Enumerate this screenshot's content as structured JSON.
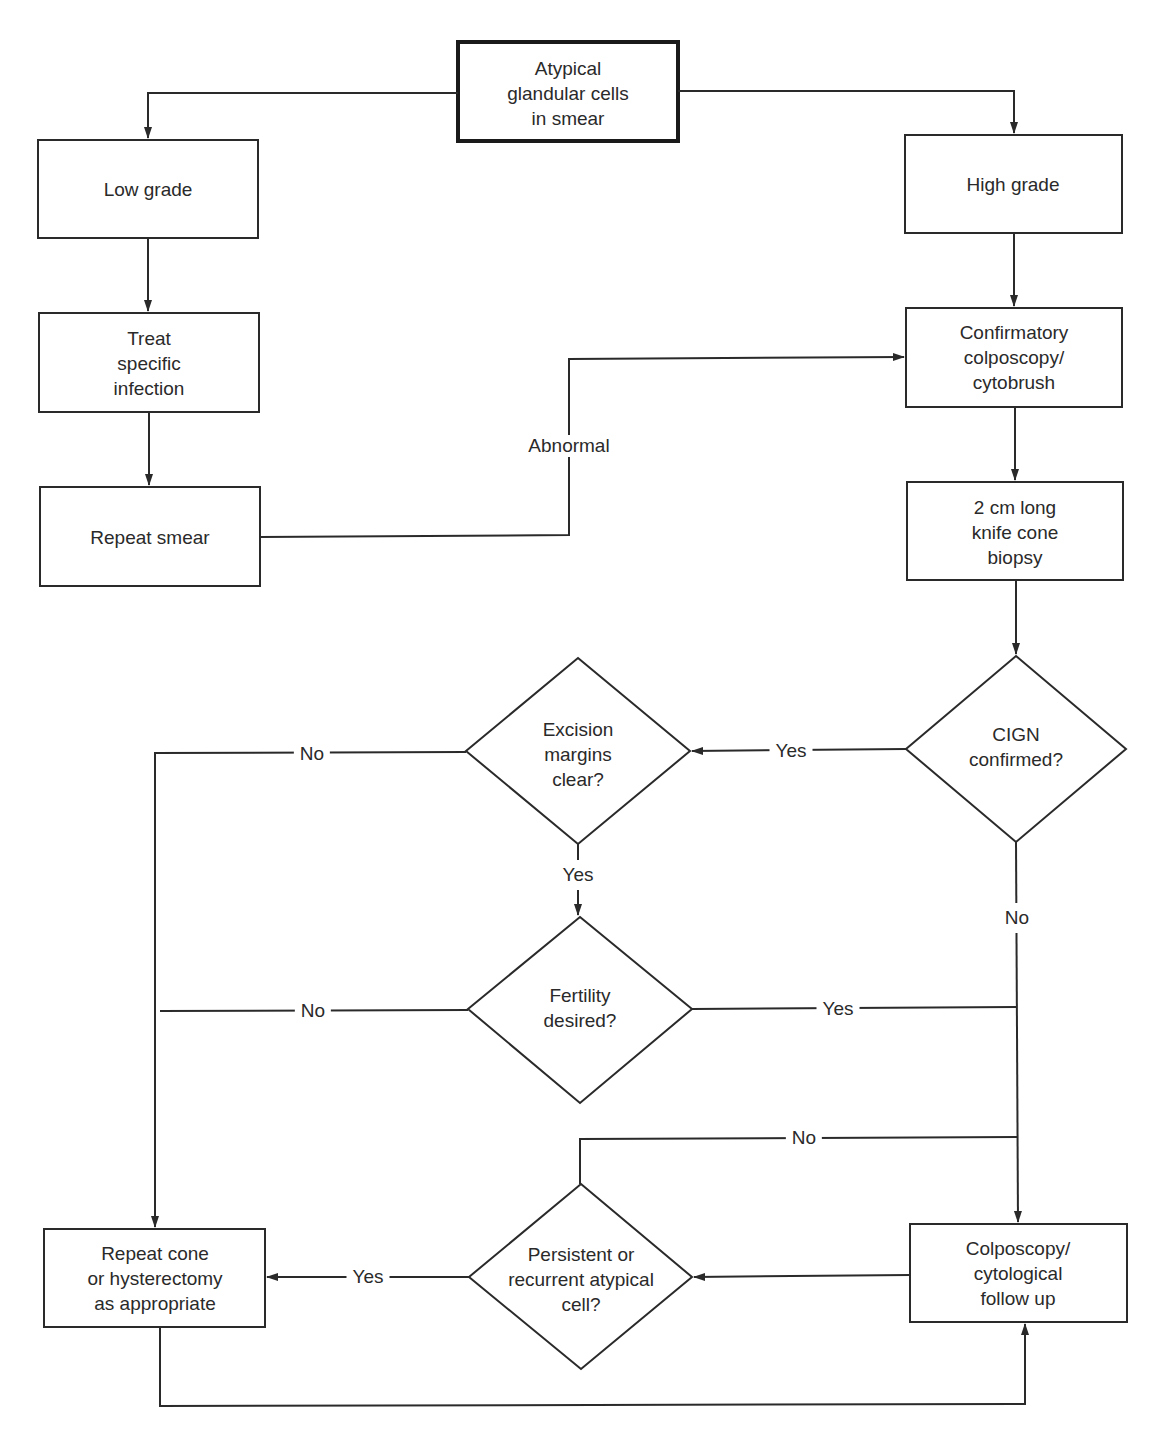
{
  "nodes": {
    "start": {
      "lines": [
        "Atypical",
        "glandular cells",
        "in smear"
      ]
    },
    "low_grade": {
      "lines": [
        "Low grade"
      ]
    },
    "high_grade": {
      "lines": [
        "High grade"
      ]
    },
    "treat_infection": {
      "lines": [
        "Treat",
        "specific",
        "infection"
      ]
    },
    "repeat_smear": {
      "lines": [
        "Repeat smear"
      ]
    },
    "confirmatory": {
      "lines": [
        "Confirmatory",
        "colposcopy/",
        "cytobrush"
      ]
    },
    "cone_biopsy": {
      "lines": [
        "2 cm long",
        "knife cone",
        "biopsy"
      ]
    },
    "cign_confirmed": {
      "lines": [
        "CIGN",
        "confirmed?"
      ]
    },
    "excision_margins": {
      "lines": [
        "Excision",
        "margins",
        "clear?"
      ]
    },
    "fertility": {
      "lines": [
        "Fertility",
        "desired?"
      ]
    },
    "persistent": {
      "lines": [
        "Persistent or",
        "recurrent atypical",
        "cell?"
      ]
    },
    "repeat_cone": {
      "lines": [
        "Repeat cone",
        "or hysterectomy",
        "as appropriate"
      ]
    },
    "followup": {
      "lines": [
        "Colposcopy/",
        "cytological",
        "follow up"
      ]
    }
  },
  "edges": {
    "abnormal": "Abnormal",
    "cign_yes": "Yes",
    "cign_no": "No",
    "margins_no": "No",
    "margins_yes": "Yes",
    "fertility_no": "No",
    "fertility_yes": "Yes",
    "followup_no": "No",
    "persistent_yes": "Yes"
  },
  "colors": {
    "line": "#2a2a2a",
    "background": "#ffffff"
  }
}
